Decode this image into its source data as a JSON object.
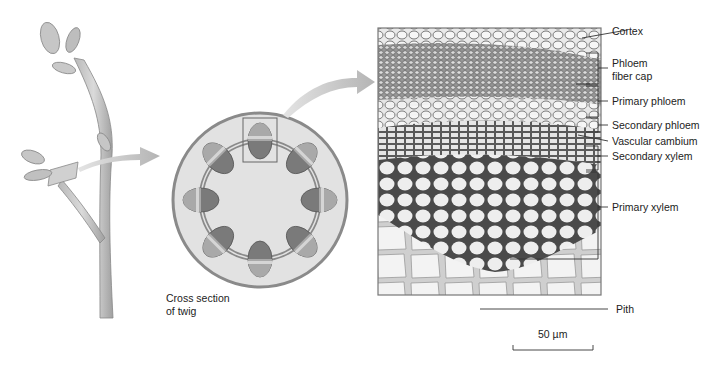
{
  "figure": {
    "panels": [
      {
        "id": "twig",
        "description": "Illustration of a woody twig with buds, arrow from cut section"
      },
      {
        "id": "cross-section",
        "description": "Schematic cross section of twig showing ring of 8 vascular bundles",
        "caption_line1": "Cross section",
        "caption_line2": "of twig"
      },
      {
        "id": "micrograph",
        "description": "Light micrograph of a vascular bundle"
      }
    ],
    "labels": [
      {
        "text": "Cortex"
      },
      {
        "text": "Phloem"
      },
      {
        "text": "fiber cap"
      },
      {
        "text": "Primary phloem"
      },
      {
        "text": "Secondary phloem"
      },
      {
        "text": "Vascular cambium"
      },
      {
        "text": "Secondary xylem"
      },
      {
        "text": "Primary xylem"
      },
      {
        "text": "Pith"
      }
    ],
    "scale_bar": {
      "text": "50 µm"
    },
    "colors": {
      "ring_gray": "#8a8a8a",
      "bundle_dark": "#7a7a7a",
      "bundle_light": "#a9a9a9",
      "interior": "#e2e2e2",
      "arrow": "#c4c4c4"
    }
  }
}
